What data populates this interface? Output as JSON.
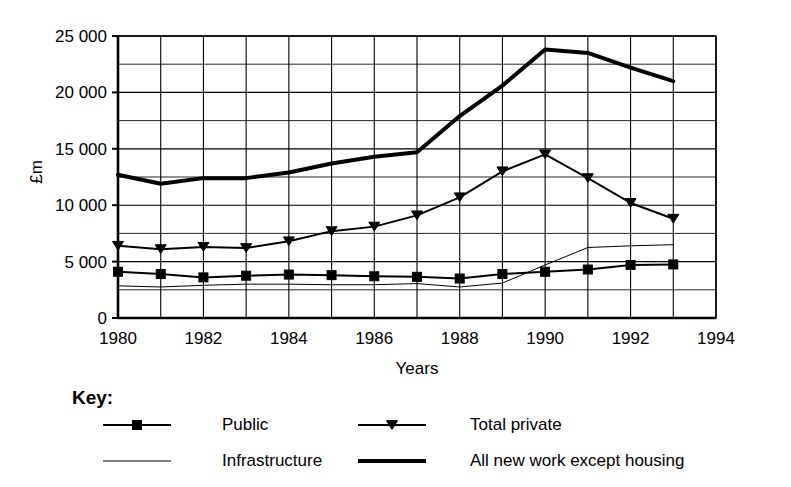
{
  "chart_data": {
    "type": "line",
    "title": "",
    "xlabel": "Years",
    "ylabel": "£m",
    "xlim": [
      1980,
      1994
    ],
    "ylim": [
      0,
      25000
    ],
    "grid": true,
    "x_tick_labels": [
      "1980",
      "1982",
      "1984",
      "1986",
      "1988",
      "1990",
      "1992",
      "1994"
    ],
    "x_tick_values": [
      1980,
      1982,
      1984,
      1986,
      1988,
      1990,
      1992,
      1994
    ],
    "x_minor_step": 1,
    "y_tick_labels": [
      "0",
      "5 000",
      "10 000",
      "15 000",
      "20 000",
      "25 000"
    ],
    "y_tick_values": [
      0,
      5000,
      10000,
      15000,
      20000,
      25000
    ],
    "y_minor_step": 2500,
    "x": [
      1980,
      1981,
      1982,
      1983,
      1984,
      1985,
      1986,
      1987,
      1988,
      1989,
      1990,
      1991,
      1992,
      1993
    ],
    "series": [
      {
        "name": "Public",
        "marker": "square",
        "line_width": 2,
        "values": [
          4100,
          3900,
          3600,
          3750,
          3850,
          3800,
          3700,
          3650,
          3500,
          3900,
          4100,
          4300,
          4700,
          4750
        ]
      },
      {
        "name": "Total private",
        "marker": "triangle-down",
        "line_width": 2,
        "values": [
          6400,
          6100,
          6300,
          6200,
          6800,
          7700,
          8100,
          9100,
          10700,
          13000,
          14500,
          12400,
          10200,
          8800
        ]
      },
      {
        "name": "Infrastructure",
        "marker": "none",
        "line_width": 1,
        "values": [
          2850,
          2750,
          2900,
          3000,
          3000,
          2950,
          2950,
          3050,
          2750,
          3100,
          4700,
          6250,
          6400,
          6500
        ]
      },
      {
        "name": "All new work except housing",
        "marker": "none",
        "line_width": 4,
        "values": [
          12700,
          11900,
          12400,
          12400,
          12900,
          13700,
          14300,
          14700,
          17900,
          20600,
          23800,
          23500,
          22200,
          21000
        ]
      }
    ],
    "legend": {
      "title": "Key:",
      "position": "below",
      "entries": [
        {
          "label": "Public",
          "marker": "square",
          "line_width": 2
        },
        {
          "label": "Total private",
          "marker": "triangle-down",
          "line_width": 2
        },
        {
          "label": "Infrastructure",
          "marker": "none",
          "line_width": 1
        },
        {
          "label": "All new work except housing",
          "marker": "none",
          "line_width": 4
        }
      ]
    },
    "colors": {
      "ink": "#000000",
      "grid": "#000000",
      "background": "#ffffff"
    }
  }
}
